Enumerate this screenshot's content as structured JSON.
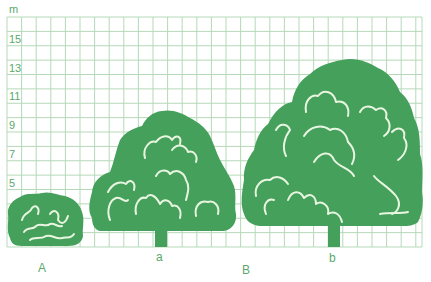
{
  "chart_data": {
    "type": "diagram",
    "title": "",
    "unit_label": "m",
    "y_axis": {
      "unit": "m",
      "range": [
        0,
        16
      ],
      "tick_labels": [
        "5",
        "7",
        "9",
        "11",
        "13",
        "15"
      ],
      "tick_values": [
        5,
        7,
        9,
        11,
        13,
        15
      ]
    },
    "grid": true,
    "plants": [
      {
        "label": "A",
        "kind": "shrub",
        "height_m": 3.5,
        "crown_width_m": 5
      },
      {
        "label": "a",
        "kind": "tree",
        "height_m": 9,
        "crown_width_m": 10,
        "trunk_height_m": 1
      },
      {
        "label": "B",
        "kind": "group-label",
        "note": ""
      },
      {
        "label": "b",
        "kind": "tree",
        "height_m": 12.5,
        "crown_width_m": 12.5,
        "trunk_height_m": 1.5
      }
    ]
  },
  "labels": {
    "unit": "m",
    "A": "A",
    "a": "a",
    "B": "B",
    "b": "b"
  },
  "colors": {
    "foliage": "#44a05a",
    "grid": "#b5d9b8",
    "text": "#5aa96a"
  }
}
